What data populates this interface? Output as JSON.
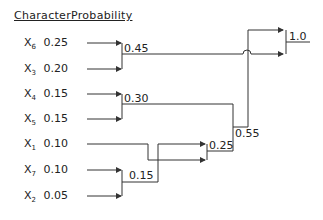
{
  "headers": {
    "character": "Character",
    "probability": "Probability"
  },
  "symbols": [
    {
      "name": "X",
      "sub": "6",
      "prob": "0.25"
    },
    {
      "name": "X",
      "sub": "3",
      "prob": "0.20"
    },
    {
      "name": "X",
      "sub": "4",
      "prob": "0.15"
    },
    {
      "name": "X",
      "sub": "5",
      "prob": "0.15"
    },
    {
      "name": "X",
      "sub": "1",
      "prob": "0.10"
    },
    {
      "name": "X",
      "sub": "7",
      "prob": "0.10"
    },
    {
      "name": "X",
      "sub": "2",
      "prob": "0.05"
    }
  ],
  "nodes": {
    "n045": "0.45",
    "n030": "0.30",
    "n015": "0.15",
    "n025": "0.25",
    "n055": "0.55",
    "root": "1.0"
  },
  "colors": {
    "line": "#333333",
    "text": "#222222"
  }
}
